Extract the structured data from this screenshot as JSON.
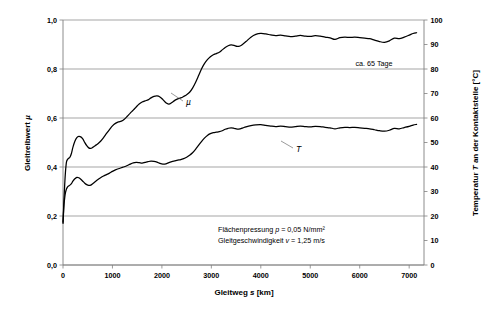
{
  "chart_data": {
    "type": "line",
    "title": "",
    "xlabel": "Gleitweg s  [km]",
    "ylabel": "Gleitreibwert µ",
    "y2label": "Temperatur T an der Kontaktstelle  [°C]",
    "xlim": [
      0,
      7300
    ],
    "ylim": [
      0.0,
      1.0
    ],
    "y2lim": [
      0,
      100
    ],
    "grid": true,
    "legend_position": "inline-annotations",
    "xticks": [
      0,
      1000,
      2000,
      3000,
      4000,
      5000,
      6000,
      7000
    ],
    "xticklabels": [
      "0",
      "1000",
      "2000",
      "3000",
      "4000",
      "5000",
      "6000",
      "7000"
    ],
    "yticks": [
      0.0,
      0.2,
      0.4,
      0.6,
      0.8,
      1.0
    ],
    "yticklabels": [
      "0,0",
      "0,2",
      "0,4",
      "0,6",
      "0,8",
      "1,0"
    ],
    "y2ticks": [
      0,
      10,
      20,
      30,
      40,
      50,
      60,
      70,
      80,
      90,
      100
    ],
    "y2ticklabels": [
      "0",
      "10",
      "20",
      "30",
      "40",
      "50",
      "60",
      "70",
      "80",
      "90",
      "100"
    ],
    "series": [
      {
        "name": "µ",
        "axis": "left",
        "label": "µ",
        "x": [
          0,
          10,
          20,
          35,
          50,
          70,
          90,
          110,
          140,
          170,
          200,
          240,
          280,
          320,
          360,
          400,
          440,
          480,
          520,
          560,
          600,
          650,
          700,
          760,
          820,
          880,
          940,
          1000,
          1060,
          1120,
          1180,
          1240,
          1300,
          1360,
          1420,
          1480,
          1540,
          1600,
          1660,
          1720,
          1780,
          1840,
          1900,
          1960,
          2020,
          2080,
          2140,
          2200,
          2260,
          2320,
          2380,
          2440,
          2500,
          2560,
          2620,
          2680,
          2740,
          2800,
          2860,
          2920,
          2980,
          3040,
          3100,
          3160,
          3220,
          3280,
          3340,
          3400,
          3460,
          3520,
          3580,
          3640,
          3700,
          3800,
          3900,
          4000,
          4100,
          4200,
          4300,
          4400,
          4500,
          4600,
          4700,
          4800,
          4900,
          5000,
          5100,
          5200,
          5300,
          5400,
          5500,
          5600,
          5700,
          5800,
          5900,
          6000,
          6100,
          6200,
          6300,
          6400,
          6500,
          6600,
          6700,
          6800,
          6900,
          7000,
          7080,
          7150
        ],
        "y": [
          0.175,
          0.22,
          0.27,
          0.33,
          0.38,
          0.42,
          0.43,
          0.435,
          0.44,
          0.455,
          0.48,
          0.505,
          0.52,
          0.525,
          0.523,
          0.515,
          0.5,
          0.487,
          0.478,
          0.476,
          0.48,
          0.487,
          0.494,
          0.505,
          0.52,
          0.537,
          0.553,
          0.568,
          0.578,
          0.584,
          0.587,
          0.595,
          0.607,
          0.62,
          0.632,
          0.645,
          0.657,
          0.665,
          0.67,
          0.674,
          0.682,
          0.688,
          0.69,
          0.686,
          0.675,
          0.662,
          0.657,
          0.663,
          0.672,
          0.678,
          0.682,
          0.688,
          0.695,
          0.705,
          0.722,
          0.745,
          0.772,
          0.8,
          0.822,
          0.838,
          0.85,
          0.858,
          0.863,
          0.868,
          0.878,
          0.888,
          0.895,
          0.898,
          0.896,
          0.892,
          0.894,
          0.902,
          0.912,
          0.93,
          0.941,
          0.945,
          0.943,
          0.939,
          0.936,
          0.938,
          0.935,
          0.932,
          0.934,
          0.937,
          0.934,
          0.933,
          0.936,
          0.934,
          0.93,
          0.927,
          0.921,
          0.928,
          0.93,
          0.929,
          0.93,
          0.928,
          0.926,
          0.924,
          0.918,
          0.912,
          0.909,
          0.915,
          0.926,
          0.924,
          0.93,
          0.938,
          0.945,
          0.948
        ]
      },
      {
        "name": "T",
        "axis": "right",
        "label": "T",
        "x": [
          0,
          10,
          20,
          35,
          50,
          70,
          90,
          110,
          140,
          170,
          200,
          240,
          280,
          320,
          360,
          400,
          440,
          480,
          520,
          560,
          600,
          650,
          700,
          760,
          820,
          880,
          940,
          1000,
          1060,
          1120,
          1180,
          1240,
          1300,
          1360,
          1420,
          1480,
          1540,
          1600,
          1660,
          1720,
          1780,
          1840,
          1900,
          1960,
          2020,
          2080,
          2140,
          2200,
          2260,
          2320,
          2380,
          2440,
          2500,
          2560,
          2620,
          2680,
          2740,
          2800,
          2860,
          2920,
          2980,
          3040,
          3100,
          3160,
          3220,
          3280,
          3340,
          3400,
          3460,
          3520,
          3580,
          3640,
          3700,
          3800,
          3900,
          4000,
          4100,
          4200,
          4300,
          4400,
          4500,
          4600,
          4700,
          4800,
          4900,
          5000,
          5100,
          5200,
          5300,
          5400,
          5500,
          5600,
          5700,
          5800,
          5900,
          6000,
          6100,
          6200,
          6300,
          6400,
          6500,
          6600,
          6700,
          6800,
          6900,
          7000,
          7080,
          7150
        ],
        "y": [
          17.0,
          21.0,
          24.5,
          27.5,
          29.5,
          31.0,
          31.8,
          32.2,
          32.6,
          33.2,
          34.2,
          35.2,
          35.8,
          35.6,
          35.0,
          34.2,
          33.4,
          32.8,
          32.5,
          32.6,
          33.2,
          34.0,
          34.8,
          35.6,
          36.3,
          36.9,
          37.5,
          38.2,
          38.8,
          39.3,
          39.7,
          40.1,
          40.6,
          41.2,
          41.7,
          41.9,
          41.8,
          41.6,
          41.9,
          42.2,
          42.4,
          42.3,
          42.0,
          41.5,
          41.2,
          41.3,
          41.8,
          42.2,
          42.5,
          42.8,
          43.0,
          43.4,
          44.0,
          44.8,
          45.8,
          47.2,
          48.8,
          50.4,
          51.8,
          52.9,
          53.6,
          54.0,
          54.2,
          54.4,
          54.8,
          55.4,
          55.8,
          56.0,
          55.8,
          55.5,
          55.6,
          56.0,
          56.4,
          56.9,
          57.2,
          57.3,
          57.0,
          56.7,
          56.5,
          56.7,
          56.5,
          56.3,
          56.5,
          56.7,
          56.5,
          56.4,
          56.6,
          56.5,
          56.2,
          56.0,
          55.6,
          56.0,
          56.2,
          56.1,
          56.2,
          56.0,
          55.8,
          55.6,
          55.2,
          54.8,
          54.6,
          55.0,
          55.8,
          55.6,
          56.1,
          56.6,
          57.1,
          57.4
        ]
      }
    ],
    "annotations": [
      {
        "id": "days-note",
        "text": "ca. 65 Tage",
        "x_px": 374,
        "y_px": 66
      },
      {
        "id": "pressure-note",
        "parts": [
          "Flächenpressung ",
          "p",
          " = 0,05 N/mm²"
        ],
        "text": "Flächenpressung p = 0,05 N/mm²",
        "x_px": 218,
        "y_px": 232
      },
      {
        "id": "velocity-note",
        "parts": [
          "Gleitgeschwindigkeit ",
          "v",
          " = 1,25 m/s"
        ],
        "text": "Gleitgeschwindigkeit v = 1,25 m/s",
        "x_px": 218,
        "y_px": 243
      }
    ],
    "colors": {
      "curve": "#000000",
      "grid": "#808080",
      "axis": "#808080",
      "background": "#ffffff",
      "text": "#000000"
    }
  },
  "labels": {
    "pressure_prefix": "Flächenpressung ",
    "pressure_symbol": "p",
    "pressure_value": " = 0,05 N/mm²",
    "velocity_prefix": "Gleitgeschwindigkeit ",
    "velocity_symbol": "v",
    "velocity_value": " = 1,25 m/s",
    "days_note": "ca. 65 Tage",
    "ylabel_prefix": "Gleitreibwert ",
    "ylabel_symbol": "µ",
    "y2label_prefix": "Temperatur ",
    "y2label_symbol": "T",
    "y2label_suffix": " an der Kontaktstelle  [°C]",
    "xlabel_prefix": "Gleitweg ",
    "xlabel_symbol": "s",
    "xlabel_suffix": "  [km]",
    "series_mu": "µ",
    "series_t": "T"
  }
}
